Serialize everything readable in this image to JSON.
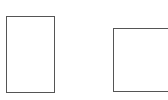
{
  "canvas": {
    "width": 168,
    "height": 100,
    "background": "#ffffff"
  },
  "shapes": [
    {
      "id": "rect-a",
      "type": "rectangle",
      "orientation": "portrait",
      "stroke": "#555555",
      "fill": "#ffffff"
    },
    {
      "id": "rect-b",
      "type": "rectangle",
      "orientation": "landscape",
      "stroke": "#555555",
      "fill": "#ffffff"
    }
  ]
}
